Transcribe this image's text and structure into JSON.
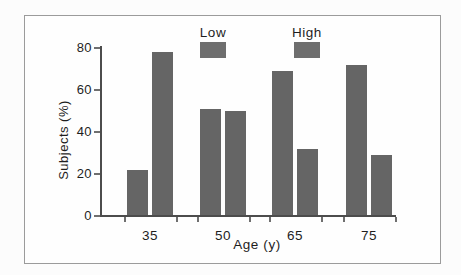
{
  "frame": {
    "border_color": "#9b9b9b",
    "background": "#fefefe"
  },
  "chart_data": {
    "type": "bar",
    "title": "",
    "xlabel": "Age (y)",
    "ylabel": "Subjects (%)",
    "categories": [
      "35",
      "50",
      "65",
      "75"
    ],
    "series": [
      {
        "name": "Low",
        "values": [
          22,
          51,
          69,
          72
        ]
      },
      {
        "name": "High",
        "values": [
          78,
          50,
          32,
          29
        ]
      }
    ],
    "ylim": [
      0,
      80
    ],
    "yticks": [
      0,
      20,
      40,
      60,
      80
    ],
    "grid": false,
    "legend_position": "top",
    "colors": {
      "bar": "#656565",
      "legend_swatch": "#6e6e6e",
      "axis": "#4c4c4c",
      "text": "#1e1e1e"
    }
  }
}
